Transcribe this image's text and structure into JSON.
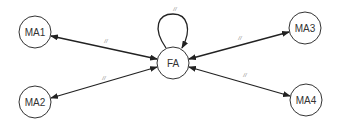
{
  "diagram": {
    "nodes": [
      {
        "id": "FA",
        "label": "FA",
        "x": 173,
        "y": 63,
        "r": 16
      },
      {
        "id": "MA1",
        "label": "MA1",
        "x": 35,
        "y": 32,
        "r": 16
      },
      {
        "id": "MA2",
        "label": "MA2",
        "x": 35,
        "y": 102,
        "r": 16
      },
      {
        "id": "MA3",
        "label": "MA3",
        "x": 305,
        "y": 28,
        "r": 16
      },
      {
        "id": "MA4",
        "label": "MA4",
        "x": 306,
        "y": 100,
        "r": 16
      }
    ],
    "edges": [
      {
        "from": "FA",
        "to": "FA",
        "label": "//",
        "type": "self-loop"
      },
      {
        "from": "FA",
        "to": "MA1",
        "label": "//",
        "type": "bidirectional"
      },
      {
        "from": "FA",
        "to": "MA2",
        "label": "//",
        "type": "bidirectional"
      },
      {
        "from": "FA",
        "to": "MA3",
        "label": "//",
        "type": "bidirectional"
      },
      {
        "from": "FA",
        "to": "MA4",
        "label": "//",
        "type": "bidirectional"
      }
    ]
  }
}
